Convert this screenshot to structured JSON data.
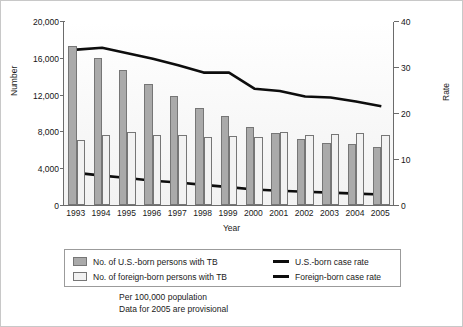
{
  "chart_data": {
    "type": "bar",
    "title": "",
    "subtitle": "",
    "xlabel": "Year",
    "ylabel": "Number",
    "y2label": "Rate",
    "ylim": [
      0,
      20000
    ],
    "y2lim": [
      0,
      40
    ],
    "grid": false,
    "legend_position": "bottom",
    "categories": [
      "1993",
      "1994",
      "1995",
      "1996",
      "1997",
      "1998",
      "1999",
      "2000",
      "2001",
      "2002",
      "2003",
      "2004",
      "2005"
    ],
    "yticks": [
      "0",
      "4,000",
      "8,000",
      "12,000",
      "16,000",
      "20,000"
    ],
    "ytick_values": [
      0,
      4000,
      8000,
      12000,
      16000,
      20000
    ],
    "y2ticks": [
      "0",
      "10",
      "20",
      "30",
      "40"
    ],
    "y2tick_values": [
      0,
      10,
      20,
      30,
      40
    ],
    "series": [
      {
        "name": "No. of U.S.-born persons with TB",
        "kind": "bar",
        "axis": "left",
        "color": "#aaaaaa",
        "values": [
          17300,
          16000,
          14700,
          13200,
          11800,
          10500,
          9700,
          8500,
          7800,
          7200,
          6700,
          6600,
          6300
        ]
      },
      {
        "name": "No. of foreign-born persons with TB",
        "kind": "bar",
        "axis": "left",
        "color": "#f2f2f2",
        "values": [
          7100,
          7600,
          7900,
          7600,
          7650,
          7400,
          7500,
          7400,
          7900,
          7600,
          7750,
          7850,
          7600
        ]
      },
      {
        "name": "Foreign-born case rate",
        "kind": "line",
        "axis": "right",
        "color": "#0d0d0d",
        "values": [
          34.0,
          34.4,
          33.2,
          32.0,
          30.6,
          29.0,
          29.0,
          25.5,
          25.0,
          23.8,
          23.6,
          22.7,
          21.7
        ]
      },
      {
        "name": "U.S.-born case rate",
        "kind": "line",
        "axis": "right",
        "color": "#0d0d0d",
        "values": [
          7.2,
          6.6,
          6.1,
          5.5,
          5.1,
          4.6,
          4.1,
          3.6,
          3.3,
          3.1,
          2.9,
          2.7,
          2.5
        ]
      }
    ],
    "legend": [
      {
        "label": "No. of U.S.-born persons with TB",
        "marker": "swatch",
        "color": "#aaaaaa"
      },
      {
        "label": "U.S.-born case rate",
        "marker": "line",
        "color": "#0d0d0d"
      },
      {
        "label": "No. of foreign-born persons with TB",
        "marker": "swatch",
        "color": "#f2f2f2"
      },
      {
        "label": "Foreign-born case rate",
        "marker": "line",
        "color": "#0d0d0d"
      }
    ],
    "annotations": [
      "Per 100,000 population",
      "Data for 2005 are provisional"
    ]
  },
  "footnote": {
    "line1": "Per 100,000 population",
    "line2": "Data for 2005 are provisional"
  }
}
